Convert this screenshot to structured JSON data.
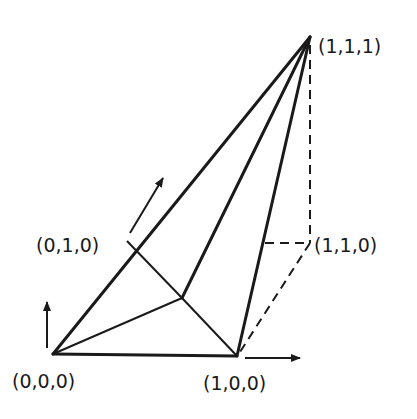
{
  "diagram": {
    "type": "unit-cube-simplex-decomposition",
    "vertices": [
      {
        "id": "v000",
        "label": "(0,0,0)"
      },
      {
        "id": "v100",
        "label": "(1,0,0)"
      },
      {
        "id": "v010",
        "label": "(0,1,0)"
      },
      {
        "id": "v110",
        "label": "(1,1,0)"
      },
      {
        "id": "v111",
        "label": "(1,1,1)"
      }
    ],
    "colors": {
      "ink": "#1a1a1a",
      "background": "#ffffff"
    }
  }
}
